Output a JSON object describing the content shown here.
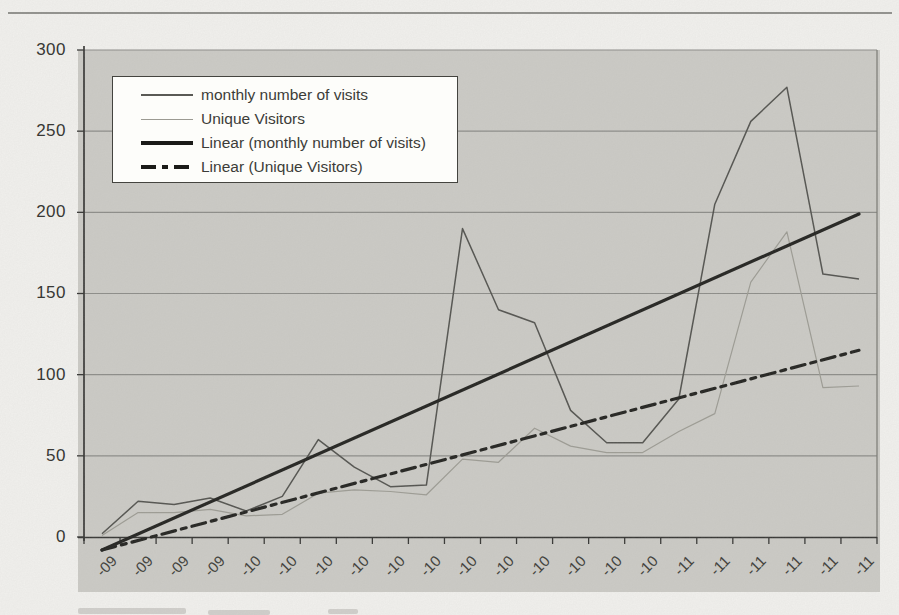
{
  "y_axis": {
    "ticks": [
      "300",
      "250",
      "200",
      "150",
      "100",
      "50",
      "0"
    ]
  },
  "legend": {
    "items": [
      {
        "label": "monthly number of visits",
        "style": "thin-dark"
      },
      {
        "label": "Unique Visitors",
        "style": "thin-light"
      },
      {
        "label": "Linear (monthly number of visits)",
        "style": "trend-solid"
      },
      {
        "label": "Linear (Unique Visitors)",
        "style": "trend-dashdot"
      }
    ]
  },
  "palette": {
    "page_bg": "#f4f3f0",
    "chart_bg": "#cccbc6",
    "grid": "#8a8a86",
    "axis": "#2f2f2d",
    "right_border": "#75756f",
    "text": "#3a3a38"
  },
  "chart_data": {
    "type": "line",
    "title": "",
    "xlabel": "",
    "ylabel": "",
    "ylim": [
      0,
      300
    ],
    "grid": true,
    "legend_position": "top-left-inside",
    "categories": [
      "-09",
      "-09",
      "-09",
      "-09",
      "-10",
      "-10",
      "-10",
      "-10",
      "-10",
      "-10",
      "-10",
      "-10",
      "-10",
      "-10",
      "-10",
      "-10",
      "-11",
      "-11",
      "-11",
      "-11",
      "-11",
      "-11"
    ],
    "series": [
      {
        "name": "monthly number of visits",
        "style": "thin-dark",
        "color": "#4e4e4a",
        "values": [
          2,
          22,
          20,
          24,
          16,
          25,
          60,
          43,
          31,
          32,
          190,
          140,
          132,
          78,
          58,
          58,
          85,
          205,
          256,
          277,
          162,
          159
        ]
      },
      {
        "name": "Unique Visitors",
        "style": "thin-light",
        "color": "#9b9a92",
        "values": [
          1,
          15,
          15,
          17,
          13,
          14,
          27,
          29,
          28,
          26,
          48,
          46,
          67,
          56,
          52,
          52,
          65,
          76,
          157,
          188,
          92,
          93
        ]
      },
      {
        "name": "Linear (monthly number of visits)",
        "style": "trend-solid",
        "color": "#1b1b18",
        "trend": [
          -8,
          199
        ]
      },
      {
        "name": "Linear (Unique Visitors)",
        "style": "trend-dashdot",
        "color": "#1b1b18",
        "trend": [
          -8,
          115
        ]
      }
    ]
  }
}
